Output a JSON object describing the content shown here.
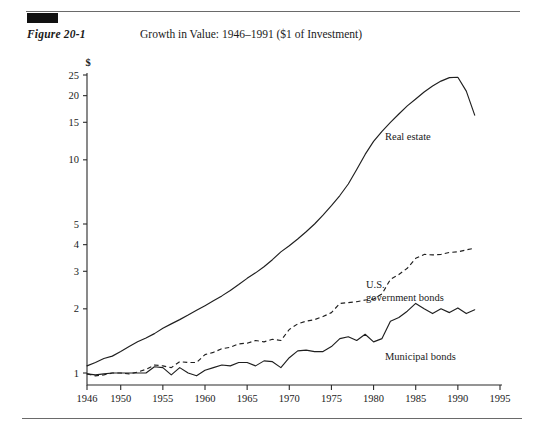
{
  "figure": {
    "label": "Figure 20-1",
    "title": "Growth in Value: 1946–1991 ($1 of Investment)"
  },
  "chart_data": {
    "type": "line",
    "title": "Growth in Value: 1946–1991 ($1 of Investment)",
    "xlabel": "",
    "ylabel": "$",
    "yscale": "log",
    "ylim": [
      1,
      25
    ],
    "xlim": [
      1946,
      1995
    ],
    "grid": false,
    "legend_position": "inline-annotations",
    "yticks": [
      1,
      2,
      3,
      4,
      5,
      10,
      15,
      20,
      25
    ],
    "ytick_labels": [
      "1",
      "2",
      "3",
      "4",
      "5",
      "10",
      "15",
      "20",
      "25"
    ],
    "xticks": [
      1946,
      1950,
      1955,
      1960,
      1965,
      1970,
      1975,
      1980,
      1985,
      1990,
      1995
    ],
    "xtick_labels": [
      "1946",
      "1950",
      "1955",
      "1960",
      "1965",
      "1970",
      "1975",
      "1980",
      "1985",
      "1990",
      "1995"
    ],
    "series": [
      {
        "name": "Real estate",
        "style": "solid",
        "annotation": "Real estate",
        "x": [
          1946,
          1947,
          1948,
          1949,
          1950,
          1951,
          1952,
          1953,
          1954,
          1955,
          1956,
          1957,
          1958,
          1959,
          1960,
          1961,
          1962,
          1963,
          1964,
          1965,
          1966,
          1967,
          1968,
          1969,
          1970,
          1971,
          1972,
          1973,
          1974,
          1975,
          1976,
          1977,
          1978,
          1979,
          1980,
          1981,
          1982,
          1983,
          1984,
          1985,
          1986,
          1987,
          1988,
          1989,
          1990,
          1991,
          1992
        ],
        "y": [
          1.08,
          1.12,
          1.17,
          1.2,
          1.26,
          1.33,
          1.4,
          1.46,
          1.53,
          1.62,
          1.7,
          1.78,
          1.87,
          1.97,
          2.07,
          2.18,
          2.3,
          2.44,
          2.6,
          2.78,
          2.95,
          3.15,
          3.4,
          3.7,
          3.95,
          4.25,
          4.6,
          5.0,
          5.5,
          6.1,
          6.8,
          7.7,
          9.0,
          10.6,
          12.2,
          13.6,
          15.0,
          16.4,
          17.9,
          19.3,
          20.8,
          22.2,
          23.4,
          24.3,
          24.4,
          21.0,
          16.2
        ]
      },
      {
        "name": "U.S. government bonds",
        "style": "dashed",
        "annotation": "U.S.\ngovernment bonds",
        "x": [
          1946,
          1947,
          1948,
          1949,
          1950,
          1951,
          1952,
          1953,
          1954,
          1955,
          1956,
          1957,
          1958,
          1959,
          1960,
          1961,
          1962,
          1963,
          1964,
          1965,
          1966,
          1967,
          1968,
          1969,
          1970,
          1971,
          1972,
          1973,
          1974,
          1975,
          1976,
          1977,
          1978,
          1979,
          1980,
          1981,
          1982,
          1983,
          1984,
          1985,
          1986,
          1987,
          1988,
          1989,
          1990,
          1991,
          1992
        ],
        "y": [
          0.99,
          0.97,
          0.98,
          1.0,
          1.0,
          0.99,
          1.01,
          1.04,
          1.09,
          1.08,
          1.06,
          1.13,
          1.12,
          1.12,
          1.22,
          1.25,
          1.3,
          1.32,
          1.37,
          1.38,
          1.42,
          1.4,
          1.44,
          1.42,
          1.6,
          1.7,
          1.75,
          1.78,
          1.84,
          1.92,
          2.12,
          2.14,
          2.16,
          2.2,
          2.22,
          2.35,
          2.75,
          2.9,
          3.1,
          3.45,
          3.6,
          3.58,
          3.6,
          3.68,
          3.7,
          3.78,
          3.85
        ]
      },
      {
        "name": "Municipal bonds",
        "style": "solid",
        "annotation": "Municipal bonds",
        "x": [
          1946,
          1947,
          1948,
          1949,
          1950,
          1951,
          1952,
          1953,
          1954,
          1955,
          1956,
          1957,
          1958,
          1959,
          1960,
          1961,
          1962,
          1963,
          1964,
          1965,
          1966,
          1967,
          1968,
          1969,
          1970,
          1971,
          1972,
          1973,
          1974,
          1975,
          1976,
          1977,
          1978,
          1979,
          1980,
          1981,
          1982,
          1983,
          1984,
          1985,
          1986,
          1987,
          1988,
          1989,
          1990,
          1991,
          1992
        ],
        "y": [
          0.99,
          0.98,
          0.99,
          1.0,
          1.0,
          1.0,
          1.0,
          1.0,
          1.07,
          1.06,
          0.98,
          1.06,
          1.0,
          0.97,
          1.03,
          1.06,
          1.09,
          1.08,
          1.12,
          1.12,
          1.08,
          1.14,
          1.13,
          1.06,
          1.18,
          1.27,
          1.28,
          1.26,
          1.26,
          1.33,
          1.45,
          1.48,
          1.42,
          1.52,
          1.4,
          1.45,
          1.75,
          1.82,
          1.95,
          2.12,
          2.0,
          1.9,
          2.0,
          1.92,
          2.02,
          1.9,
          1.98
        ]
      }
    ]
  }
}
